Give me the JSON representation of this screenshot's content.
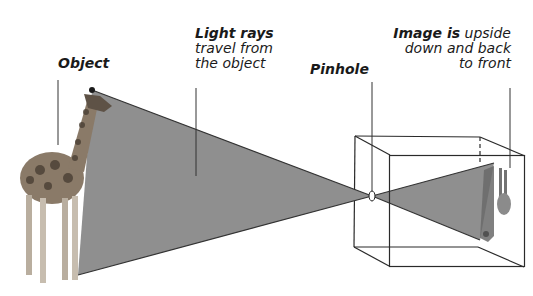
{
  "diagram": {
    "labels": {
      "object": "Object",
      "light_rays": {
        "bold": "Light rays",
        "line2": "travel from",
        "line3": "the object"
      },
      "pinhole": "Pinhole",
      "image": {
        "bold": "Image is",
        "line1_rest": " upside",
        "line2": "down and back",
        "line3": "to front"
      }
    },
    "colors": {
      "ray_fill": "#8f8f8f",
      "ray_edge": "#333333",
      "box_line": "#2a2a2a",
      "pointer_line": "#333333",
      "text": "#1a1a1a"
    },
    "elements": [
      "giraffe (object)",
      "light ray cone",
      "pinhole",
      "camera box",
      "inverted image"
    ]
  }
}
